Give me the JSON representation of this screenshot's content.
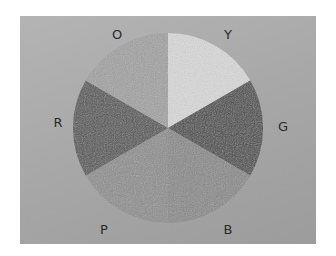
{
  "diagram": {
    "type": "color-wheel",
    "center": [
      168,
      128
    ],
    "radius": 95,
    "segments": [
      {
        "label": "Y",
        "start_deg": 0,
        "end_deg": 60,
        "fill": "#d9d9d9",
        "texture": "smooth",
        "label_pos": [
          228,
          34
        ]
      },
      {
        "label": "G",
        "start_deg": 60,
        "end_deg": 120,
        "fill": "#4c4c4c",
        "texture": "scribble",
        "label_pos": [
          283,
          126
        ]
      },
      {
        "label": "B",
        "start_deg": 120,
        "end_deg": 180,
        "fill": "#8a8a8a",
        "texture": "smooth",
        "label_pos": [
          228,
          229
        ]
      },
      {
        "label": "P",
        "start_deg": 180,
        "end_deg": 240,
        "fill": "#8f8f8f",
        "texture": "speckle",
        "label_pos": [
          104,
          229
        ]
      },
      {
        "label": "R",
        "start_deg": 240,
        "end_deg": 300,
        "fill": "#575757",
        "texture": "speckle",
        "label_pos": [
          58,
          122
        ]
      },
      {
        "label": "O",
        "start_deg": 300,
        "end_deg": 360,
        "fill": "#a2a2a2",
        "texture": "smooth",
        "label_pos": [
          117,
          34
        ]
      }
    ]
  },
  "chart_data": {
    "type": "pie",
    "categories": [
      "Y",
      "G",
      "B",
      "P",
      "R",
      "O"
    ],
    "values": [
      1,
      1,
      1,
      1,
      1,
      1
    ],
    "title": "",
    "legend": "labels placed outside each slice",
    "start_angle": "12 o'clock, clockwise"
  }
}
